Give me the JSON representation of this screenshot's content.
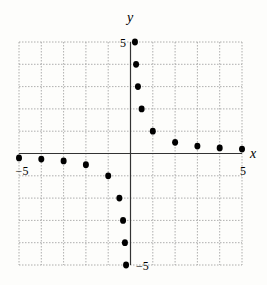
{
  "chart_data": {
    "type": "scatter",
    "title": "",
    "xlabel": "x",
    "ylabel": "y",
    "xlim": [
      -5,
      5
    ],
    "ylim": [
      -5,
      5
    ],
    "grid": true,
    "tick_labels": {
      "x_min": "−5",
      "x_max": "5",
      "y_max": "5",
      "y_min": "−5"
    },
    "series": [
      {
        "name": "y = 1/x",
        "points": [
          [
            0.2,
            5
          ],
          [
            0.25,
            4
          ],
          [
            0.333,
            3
          ],
          [
            0.5,
            2
          ],
          [
            1,
            1
          ],
          [
            2,
            0.5
          ],
          [
            3,
            0.333
          ],
          [
            4,
            0.25
          ],
          [
            5,
            0.2
          ],
          [
            -5,
            -0.2
          ],
          [
            -4,
            -0.25
          ],
          [
            -3,
            -0.333
          ],
          [
            -2,
            -0.5
          ],
          [
            -1,
            -1
          ],
          [
            -0.5,
            -2
          ],
          [
            -0.333,
            -3
          ],
          [
            -0.25,
            -4
          ],
          [
            -0.2,
            -5
          ]
        ]
      }
    ]
  }
}
